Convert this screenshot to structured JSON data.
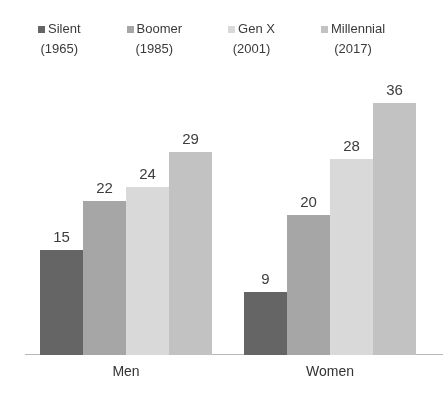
{
  "chart_data": {
    "type": "bar",
    "categories": [
      "Men",
      "Women"
    ],
    "series": [
      {
        "name": "Silent",
        "year": "(1965)",
        "color": "#656565",
        "values": [
          15,
          9
        ]
      },
      {
        "name": "Boomer",
        "year": "(1985)",
        "color": "#a6a6a6",
        "values": [
          22,
          20
        ]
      },
      {
        "name": "Gen X",
        "year": "(2001)",
        "color": "#d9d9d9",
        "values": [
          24,
          28
        ]
      },
      {
        "name": "Millennial",
        "year": "(2017)",
        "color": "#c2c2c2",
        "values": [
          29,
          36
        ]
      }
    ],
    "title": "",
    "xlabel": "",
    "ylabel": "",
    "ylim": [
      0,
      38
    ],
    "grid": false,
    "legend_position": "top",
    "axis_line_color": "#b8b8b8",
    "value_label_color": "#3d3d3d"
  }
}
